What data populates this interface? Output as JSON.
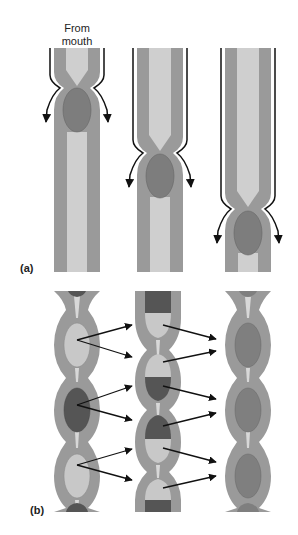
{
  "labels": {
    "from_mouth_line1": "From",
    "from_mouth_line2": "mouth",
    "panel_a": "(a)",
    "panel_b": "(b)"
  },
  "colors": {
    "wall": "#9a9a9a",
    "lumen": "#cfcfcf",
    "bolus": "#7d7d7d",
    "segment_light": "#c8c8c8",
    "segment_dark": "#555555",
    "segment_mid": "#7f7f7f",
    "arrow": "#111111"
  },
  "panel_a": {
    "description": "Peristalsis: a constriction wave moves a bolus down the tube",
    "stages": [
      {
        "center_x": 77,
        "constriction_y": 82,
        "bolus_y": 110
      },
      {
        "center_x": 160,
        "constriction_y": 147,
        "bolus_y": 176
      },
      {
        "center_x": 248,
        "constriction_y": 203,
        "bolus_y": 233
      }
    ]
  },
  "panel_b": {
    "description": "Segmentation: contents are divided and mixed between adjacent segments",
    "columns": [
      {
        "center_x": 77,
        "segments": [
          "light",
          "dark",
          "light"
        ]
      },
      {
        "center_x": 158,
        "segments": [
          "dark/light",
          "light/dark",
          "dark/light",
          "light/dark"
        ]
      },
      {
        "center_x": 248,
        "segments": [
          "mid",
          "mid",
          "mid"
        ]
      }
    ]
  }
}
